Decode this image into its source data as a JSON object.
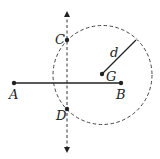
{
  "diagram": {
    "type": "geometry-construction",
    "colors": {
      "stroke": "#222222",
      "background": "#ffffff"
    },
    "points": {
      "A": {
        "label": "A",
        "x": 14,
        "y": 83
      },
      "B": {
        "label": "B",
        "x": 121,
        "y": 83
      },
      "C": {
        "label": "C",
        "x": 67,
        "y": 40
      },
      "D": {
        "label": "D",
        "x": 67,
        "y": 109
      },
      "G": {
        "label": "G",
        "x": 102,
        "y": 74
      }
    },
    "segment_AB": {
      "from": "A",
      "to": "B",
      "style": "solid"
    },
    "bisector_line": {
      "x": 67,
      "y_top": 12,
      "y_bottom": 152,
      "style": "dashed",
      "arrows": "both"
    },
    "circle": {
      "center": "G",
      "cx": 102.5,
      "cy": 75,
      "r": 49.5,
      "style": "dashed"
    },
    "radius": {
      "label": "d",
      "from_x": 102,
      "from_y": 74,
      "to_x": 136,
      "to_y": 40,
      "style": "solid"
    },
    "labels": {
      "A": "A",
      "B": "B",
      "C": "C",
      "D": "D",
      "G": "G",
      "d": "d"
    }
  }
}
